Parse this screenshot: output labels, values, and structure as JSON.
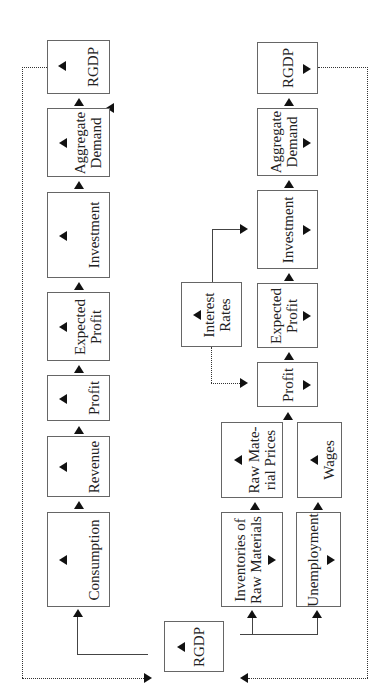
{
  "diagram": {
    "orientation": "rotated 90 degrees counter-clockwise",
    "top_chain": [
      {
        "id": "consumption",
        "label": "Consumption",
        "direction": "increase"
      },
      {
        "id": "revenue",
        "label": "Revenue",
        "direction": "increase"
      },
      {
        "id": "profit",
        "label": "Profit",
        "direction": "increase"
      },
      {
        "id": "expected_profit",
        "label": "Expected Profit",
        "direction": "increase"
      },
      {
        "id": "investment",
        "label": "Investment",
        "direction": "increase"
      },
      {
        "id": "aggregate_demand",
        "label": "Aggregate Demand",
        "direction": "increase"
      },
      {
        "id": "rgdp",
        "label": "RGDP",
        "direction": "increase"
      }
    ],
    "bottom_chain": [
      {
        "id": "inventories",
        "label": "Inventories of Raw Materials",
        "direction": "decrease"
      },
      {
        "id": "raw_material_prices",
        "label": "Raw Material Prices",
        "direction": "increase"
      },
      {
        "id": "unemployment",
        "label": "Unemployment",
        "direction": "decrease"
      },
      {
        "id": "wages",
        "label": "Wages",
        "direction": "increase"
      },
      {
        "id": "interest_rates",
        "label": "Interest Rates",
        "direction": "increase"
      },
      {
        "id": "profit",
        "label": "Profit",
        "direction": "decrease"
      },
      {
        "id": "expected_profit",
        "label": "Expected Profit",
        "direction": "decrease"
      },
      {
        "id": "investment",
        "label": "Investment",
        "direction": "decrease"
      },
      {
        "id": "aggregate_demand",
        "label": "Aggregate Demand",
        "direction": "decrease"
      },
      {
        "id": "rgdp",
        "label": "RGDP",
        "direction": "decrease"
      }
    ],
    "start_node": {
      "label": "RGDP",
      "direction": "increase"
    },
    "labels": {
      "consumption": "Consumption",
      "revenue": "Revenue",
      "profit": "Profit",
      "expected_profit_l1": "Expected",
      "expected_profit_l2": "Profit",
      "investment": "Investment",
      "aggregate_demand_l1": "Aggregate",
      "aggregate_demand_l2": "Demand",
      "rgdp": "RGDP",
      "interest_rates_l1": "Interest",
      "interest_rates_l2": "Rates",
      "raw_material_prices_l1": "Raw Mate-",
      "raw_material_prices_l2": "rial Prices",
      "wages": "Wages",
      "inventories_l1": "Inventories of",
      "inventories_l2": "Raw Materials",
      "unemployment": "Unemployment"
    },
    "edges": [
      {
        "from": "RGDP (start)",
        "to": "Consumption",
        "style": "solid"
      },
      {
        "from": "Consumption",
        "to": "Revenue",
        "style": "solid"
      },
      {
        "from": "Revenue",
        "to": "Profit",
        "style": "solid"
      },
      {
        "from": "Profit",
        "to": "Expected Profit",
        "style": "solid"
      },
      {
        "from": "Expected Profit",
        "to": "Investment",
        "style": "solid"
      },
      {
        "from": "Investment",
        "to": "Aggregate Demand",
        "style": "solid"
      },
      {
        "from": "Aggregate Demand",
        "to": "RGDP",
        "style": "solid"
      },
      {
        "from": "RGDP (top chain end)",
        "to": "RGDP (start)",
        "style": "dotted"
      },
      {
        "from": "RGDP (start)",
        "to": "Inventories of Raw Materials",
        "style": "solid"
      },
      {
        "from": "RGDP (start)",
        "to": "Unemployment",
        "style": "solid"
      },
      {
        "from": "Inventories of Raw Materials",
        "to": "Raw Material Prices",
        "style": "solid"
      },
      {
        "from": "Unemployment",
        "to": "Wages",
        "style": "solid"
      },
      {
        "from": "Raw Material Prices",
        "to": "Profit (lower)",
        "style": "solid"
      },
      {
        "from": "Interest Rates",
        "to": "Profit (lower)",
        "style": "dotted"
      },
      {
        "from": "Interest Rates",
        "to": "Investment (lower)",
        "style": "solid"
      },
      {
        "from": "Profit (lower)",
        "to": "Expected Profit (lower)",
        "style": "solid"
      },
      {
        "from": "Expected Profit (lower)",
        "to": "Investment (lower)",
        "style": "solid"
      },
      {
        "from": "Investment (lower)",
        "to": "Aggregate Demand (lower)",
        "style": "solid"
      },
      {
        "from": "Aggregate Demand (lower)",
        "to": "RGDP (lower)",
        "style": "solid"
      },
      {
        "from": "RGDP (lower chain end)",
        "to": "RGDP (start)",
        "style": "dotted"
      }
    ]
  }
}
